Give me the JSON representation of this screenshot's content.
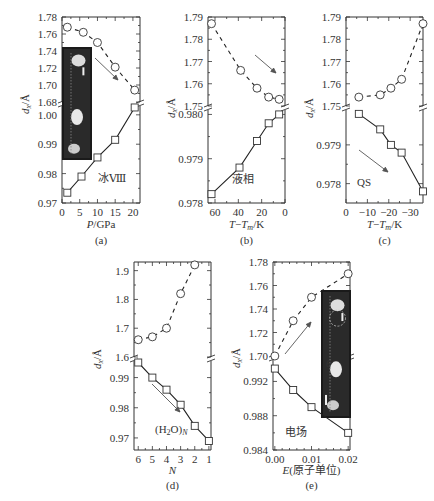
{
  "figure": {
    "ylabel": "d_x/Å"
  },
  "chart_data": [
    {
      "id": "a",
      "panel_label": "(a)",
      "type": "line",
      "xlabel": "P/GPa",
      "ylabel": "d_x/Å",
      "annotation": "冰Ⅷ",
      "has_inset_image": true,
      "arrow_direction": "down-right",
      "broken_y_axis": true,
      "x_ticks": [
        0,
        5,
        10,
        15,
        20
      ],
      "xlim": [
        0,
        22
      ],
      "upper": {
        "ylim": [
          1.68,
          1.78
        ],
        "y_ticks": [
          1.68,
          1.7,
          1.72,
          1.74,
          1.76,
          1.78
        ],
        "marker": "circle",
        "line": "dashed",
        "x": [
          1.5,
          6,
          10,
          15,
          20.5
        ],
        "y": [
          1.768,
          1.762,
          1.75,
          1.721,
          1.694
        ]
      },
      "lower": {
        "ylim": [
          0.97,
          1.003
        ],
        "y_ticks": [
          0.97,
          0.98,
          0.99,
          1.0
        ],
        "marker": "square",
        "line": "solid",
        "x": [
          1.5,
          5.5,
          10,
          15,
          20.5
        ],
        "y": [
          0.9735,
          0.979,
          0.9855,
          0.9915,
          1.0025
        ]
      }
    },
    {
      "id": "b",
      "panel_label": "(b)",
      "type": "line",
      "xlabel": "T−Tm/K",
      "ylabel": "d_x/Å",
      "annotation": "液相",
      "arrow_direction": "down-right",
      "broken_y_axis": true,
      "x_ticks": [
        60,
        40,
        20,
        0
      ],
      "xlim": [
        66,
        0
      ],
      "upper": {
        "ylim": [
          1.75,
          1.79
        ],
        "y_ticks": [
          1.75,
          1.76,
          1.77,
          1.78,
          1.79
        ],
        "marker": "circle",
        "line": "dashed",
        "x": [
          63,
          38,
          24,
          14,
          5
        ],
        "y": [
          1.787,
          1.766,
          1.758,
          1.754,
          1.753
        ]
      },
      "lower": {
        "ylim": [
          0.978,
          0.9801
        ],
        "y_ticks": [
          0.978,
          0.979,
          0.98
        ],
        "marker": "square",
        "line": "solid",
        "x": [
          63,
          39,
          24,
          14,
          5
        ],
        "y": [
          0.9782,
          0.9788,
          0.9794,
          0.9798,
          0.98
        ]
      }
    },
    {
      "id": "c",
      "panel_label": "(c)",
      "type": "line",
      "xlabel": "T−Tm/K",
      "ylabel": "d_x/Å",
      "annotation": "QS",
      "arrow_direction": "down-right",
      "broken_y_axis": true,
      "x_ticks": [
        0,
        -10,
        -20,
        -30
      ],
      "xlim": [
        0,
        -36
      ],
      "upper": {
        "ylim": [
          1.75,
          1.79
        ],
        "y_ticks": [
          1.75,
          1.76,
          1.77,
          1.78,
          1.79
        ],
        "marker": "circle",
        "line": "dashed",
        "x": [
          -6,
          -16,
          -21,
          -26,
          -36
        ],
        "y": [
          1.754,
          1.755,
          1.758,
          1.762,
          1.787
        ]
      },
      "lower": {
        "ylim": [
          0.9775,
          0.9799
        ],
        "y_ticks": [
          0.978,
          0.979
        ],
        "marker": "square",
        "line": "solid",
        "x": [
          -6,
          -16,
          -21,
          -26,
          -36
        ],
        "y": [
          0.9798,
          0.9794,
          0.979,
          0.9788,
          0.9778
        ]
      }
    },
    {
      "id": "d",
      "panel_label": "(d)",
      "type": "line",
      "xlabel": "N",
      "ylabel": "d_x/Å",
      "annotation": "(H₂O)N",
      "arrow_direction": "down-right",
      "broken_y_axis": true,
      "x_ticks": [
        6,
        5,
        4,
        3,
        2,
        1
      ],
      "xlim": [
        6.3,
        0.85
      ],
      "upper": {
        "ylim": [
          1.6,
          1.93
        ],
        "y_ticks": [
          1.6,
          1.7,
          1.8,
          1.9
        ],
        "marker": "circle",
        "line": "dashed",
        "x": [
          6,
          5,
          4,
          3,
          2
        ],
        "y": [
          1.66,
          1.67,
          1.7,
          1.82,
          1.92
        ]
      },
      "lower": {
        "ylim": [
          0.966,
          0.9955
        ],
        "y_ticks": [
          0.97,
          0.98,
          0.99
        ],
        "marker": "square",
        "line": "solid",
        "x": [
          6,
          5,
          4,
          3,
          2,
          1
        ],
        "y": [
          0.995,
          0.99,
          0.986,
          0.981,
          0.974,
          0.969
        ]
      }
    },
    {
      "id": "e",
      "panel_label": "(e)",
      "type": "line",
      "xlabel": "E(原子单位)",
      "ylabel": "d_x/Å",
      "annotation": "电场",
      "has_inset_image": true,
      "arrow_direction": "up-right",
      "broken_y_axis": true,
      "x_ticks": [
        0.0,
        0.01,
        0.02
      ],
      "xlim": [
        -0.0005,
        0.0205
      ],
      "upper": {
        "ylim": [
          1.7,
          1.78
        ],
        "y_ticks": [
          1.7,
          1.72,
          1.74,
          1.76,
          1.78
        ],
        "marker": "circle",
        "line": "dashed",
        "x": [
          0.0,
          0.005,
          0.01,
          0.02
        ],
        "y": [
          1.7,
          1.73,
          1.75,
          1.77
        ]
      },
      "lower": {
        "ylim": [
          0.984,
          0.9945
        ],
        "y_ticks": [
          0.984,
          0.988,
          0.992
        ],
        "marker": "square",
        "line": "solid",
        "x": [
          0.0,
          0.005,
          0.01,
          0.02
        ],
        "y": [
          0.9935,
          0.991,
          0.989,
          0.986
        ]
      }
    }
  ]
}
